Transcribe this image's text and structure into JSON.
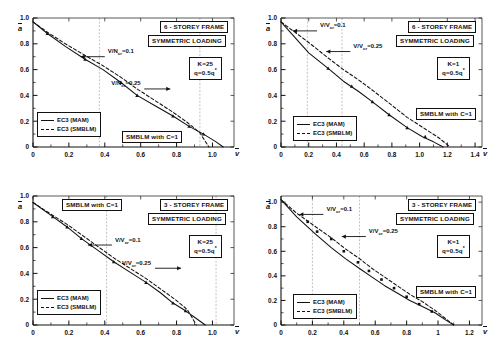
{
  "figure": {
    "axis_labels": {
      "x": "v",
      "y": "a"
    },
    "legend": {
      "solid": "EC3 (MAM)",
      "dashed": "EC3 (SMBLM)"
    }
  },
  "chart_data": [
    {
      "id": "top-left",
      "type": "line",
      "title": "6 - STOREY FRAME",
      "subtitle": "SYMMETRIC LOADING",
      "params": {
        "K": "K=25",
        "q": "q=0.5q"
      },
      "note": "SMBLM with C=1",
      "xlabel": "v",
      "ylabel": "a",
      "xlim": [
        0,
        1.12
      ],
      "ylim": [
        0,
        1.0
      ],
      "xticks": [
        0,
        0.2,
        0.4,
        0.6,
        0.8,
        1.0
      ],
      "xticklabels": [
        "0",
        "0.2",
        "0.4",
        "0.6",
        "0.8",
        "1.0"
      ],
      "yticks": [
        0,
        0.2,
        0.4,
        0.6,
        0.8,
        1.0
      ],
      "yticklabels": [
        "0",
        "0.2",
        "0.4",
        "0.6",
        "0.8",
        "1.0"
      ],
      "grid": "vertical",
      "gridlines_x": [
        0.37,
        0.93
      ],
      "annotations": [
        {
          "text": "V/N",
          "sub": "cr",
          "eq": "=0.1",
          "arrow": "left",
          "x": 0.4,
          "y": 0.7
        },
        {
          "text": "V/N",
          "sub": "cr",
          "eq": "=0.25",
          "arrow": "right",
          "x": 0.62,
          "y": 0.45
        }
      ],
      "series": [
        {
          "name": "EC3 (MAM)",
          "style": "solid",
          "x": [
            0.0,
            0.08,
            0.18,
            0.29,
            0.39,
            0.49,
            0.58,
            0.68,
            0.78,
            0.87,
            0.95,
            1.02,
            1.06
          ],
          "y": [
            0.97,
            0.88,
            0.78,
            0.68,
            0.6,
            0.5,
            0.4,
            0.32,
            0.24,
            0.16,
            0.1,
            0.04,
            0.0
          ]
        },
        {
          "name": "EC3 (SMBLM)",
          "style": "dashed",
          "x": [
            0.0,
            0.08,
            0.18,
            0.29,
            0.39,
            0.49,
            0.58,
            0.68,
            0.78,
            0.86,
            0.93,
            0.98
          ],
          "y": [
            0.97,
            0.89,
            0.8,
            0.71,
            0.63,
            0.54,
            0.45,
            0.36,
            0.27,
            0.19,
            0.11,
            0.0
          ]
        }
      ],
      "markers_x": [
        0.08,
        0.29,
        0.49,
        0.58,
        0.78,
        0.87,
        0.95
      ],
      "markers_y": [
        0.88,
        0.68,
        0.5,
        0.4,
        0.24,
        0.16,
        0.1
      ]
    },
    {
      "id": "top-right",
      "type": "line",
      "title": "6 - STOREY FRAME",
      "subtitle": "SYMMETRIC LOADING",
      "params": {
        "K": "K=1",
        "q": "q=0.5q"
      },
      "note": "SMBLM with C=1",
      "xlabel": "v",
      "ylabel": "a",
      "xlim": [
        0,
        1.45
      ],
      "ylim": [
        0,
        1.0
      ],
      "xticks": [
        0,
        0.2,
        0.4,
        0.6,
        0.8,
        1.0,
        1.2,
        1.4
      ],
      "xticklabels": [
        "0",
        "0.2",
        "0.4",
        "0.6",
        "0.8",
        "1.0",
        "1.2",
        "1.4"
      ],
      "yticks": [
        0,
        0.2,
        0.4,
        0.6,
        0.8,
        1.0
      ],
      "yticklabels": [
        "0",
        "0.2",
        "0.4",
        "0.6",
        "0.8",
        "1.0"
      ],
      "grid": "vertical",
      "gridlines_x": [
        0.19,
        0.44
      ],
      "annotations": [
        {
          "text": "V/V",
          "sub": "cr",
          "eq": "=0.1",
          "arrow": "left",
          "x": 0.26,
          "y": 0.9
        },
        {
          "text": "V/V",
          "sub": "cr",
          "eq": "=0.25",
          "arrow": "left",
          "x": 0.5,
          "y": 0.74
        }
      ],
      "series": [
        {
          "name": "EC3 (MAM)",
          "style": "solid",
          "x": [
            0.0,
            0.1,
            0.2,
            0.34,
            0.45,
            0.56,
            0.66,
            0.78,
            0.91,
            1.02,
            1.1,
            1.17
          ],
          "y": [
            0.97,
            0.85,
            0.73,
            0.61,
            0.51,
            0.43,
            0.35,
            0.25,
            0.15,
            0.08,
            0.04,
            0.0
          ]
        },
        {
          "name": "EC3 (SMBLM)",
          "style": "dashed",
          "x": [
            0.0,
            0.1,
            0.2,
            0.34,
            0.45,
            0.56,
            0.66,
            0.78,
            0.91,
            1.04,
            1.14,
            1.22
          ],
          "y": [
            0.97,
            0.89,
            0.81,
            0.69,
            0.6,
            0.52,
            0.44,
            0.34,
            0.23,
            0.14,
            0.07,
            0.0
          ]
        }
      ],
      "markers_x": [
        0.34,
        0.51,
        0.66,
        0.78,
        0.91,
        1.04
      ],
      "markers_y": [
        0.61,
        0.47,
        0.35,
        0.25,
        0.15,
        0.08
      ]
    },
    {
      "id": "bottom-left",
      "type": "line",
      "title": "3 - STOREY FRAME",
      "subtitle": "SYMMETRIC LOADING",
      "params": {
        "K": "K=25",
        "q": "q=0.5q"
      },
      "note": "SMBLM with C=1",
      "xlabel": "v",
      "ylabel": "a",
      "xlim": [
        0,
        1.12
      ],
      "ylim": [
        0,
        1.0
      ],
      "xticks": [
        0,
        0.2,
        0.4,
        0.6,
        0.8,
        1.0
      ],
      "xticklabels": [
        "0",
        "0.2",
        "0.4",
        "0.6",
        "0.8",
        "1.0"
      ],
      "yticks": [
        0,
        0.2,
        0.4,
        0.6,
        0.8,
        1.0
      ],
      "yticklabels": [
        "0",
        "0.2",
        "0.4",
        "0.6",
        "0.8",
        "1.0"
      ],
      "grid": "vertical",
      "gridlines_x": [
        0.41,
        1.02
      ],
      "annotations": [
        {
          "text": "V/V",
          "sub": "cr",
          "eq": "=0.1",
          "arrow": "left",
          "x": 0.44,
          "y": 0.62
        },
        {
          "text": "V/V",
          "sub": "cr",
          "eq": "=0.25",
          "arrow": "right",
          "x": 0.68,
          "y": 0.44
        }
      ],
      "series": [
        {
          "name": "EC3 (MAM)",
          "style": "solid",
          "x": [
            0.0,
            0.11,
            0.19,
            0.27,
            0.36,
            0.45,
            0.54,
            0.63,
            0.71,
            0.78,
            0.85,
            0.9,
            0.96
          ],
          "y": [
            0.95,
            0.84,
            0.76,
            0.67,
            0.58,
            0.49,
            0.41,
            0.33,
            0.25,
            0.17,
            0.11,
            0.06,
            0.0
          ]
        },
        {
          "name": "EC3 (SMBLM)",
          "style": "dashed",
          "x": [
            0.0,
            0.11,
            0.19,
            0.27,
            0.36,
            0.45,
            0.54,
            0.63,
            0.71,
            0.79,
            0.86,
            0.91
          ],
          "y": [
            0.95,
            0.85,
            0.78,
            0.7,
            0.61,
            0.52,
            0.44,
            0.36,
            0.28,
            0.2,
            0.12,
            0.0
          ]
        }
      ],
      "markers_x": [
        0.11,
        0.19,
        0.27,
        0.45,
        0.63,
        0.78,
        0.85
      ],
      "markers_y": [
        0.84,
        0.76,
        0.67,
        0.49,
        0.33,
        0.17,
        0.11
      ]
    },
    {
      "id": "bottom-right",
      "type": "scatter",
      "title": "3 - STOREY FRAME",
      "subtitle": "SYMMETRIC LOADING",
      "params": {
        "K": "K=1",
        "q": "q=0.5q"
      },
      "note": "SMBLM with C=1",
      "xlabel": "v",
      "ylabel": "a",
      "xlim": [
        0,
        1.28
      ],
      "ylim": [
        0,
        1.05
      ],
      "xticks": [
        0,
        0.2,
        0.4,
        0.6,
        0.8,
        1.0,
        1.2
      ],
      "xticklabels": [
        "0",
        "0.2",
        "0.4",
        "0.6",
        "0.8",
        "1",
        "1.2"
      ],
      "yticks": [
        0,
        0.2,
        0.4,
        0.6,
        0.8,
        1.0
      ],
      "yticklabels": [
        "0",
        "0.2",
        "0.4",
        "0.6",
        "0.8",
        "1.0"
      ],
      "grid": "vertical",
      "gridlines_x": [
        0.2,
        0.5
      ],
      "annotations": [
        {
          "text": "V/V",
          "sub": "cr",
          "eq": "=0.1",
          "arrow": "left",
          "x": 0.27,
          "y": 0.9
        },
        {
          "text": "V/V",
          "sub": "cr",
          "eq": "=0.25",
          "arrow": "left",
          "x": 0.54,
          "y": 0.72
        }
      ],
      "series": [
        {
          "name": "EC3 (MAM)",
          "style": "solid",
          "x": [
            0.0,
            0.1,
            0.22,
            0.32,
            0.41,
            0.5,
            0.58,
            0.66,
            0.74,
            0.82,
            0.9,
            0.98,
            1.05,
            1.1
          ],
          "y": [
            1.02,
            0.88,
            0.74,
            0.63,
            0.54,
            0.46,
            0.39,
            0.32,
            0.26,
            0.2,
            0.15,
            0.1,
            0.04,
            0.0
          ]
        },
        {
          "name": "EC3 (SMBLM)",
          "style": "dashed",
          "x": [
            0.0,
            0.1,
            0.22,
            0.32,
            0.41,
            0.5,
            0.58,
            0.66,
            0.74,
            0.82,
            0.9,
            0.98,
            1.05,
            1.1
          ],
          "y": [
            1.02,
            0.91,
            0.8,
            0.71,
            0.62,
            0.54,
            0.46,
            0.39,
            0.32,
            0.25,
            0.19,
            0.12,
            0.05,
            0.0
          ]
        }
      ],
      "markers_x": [
        0.17,
        0.23,
        0.32,
        0.4,
        0.49,
        0.56,
        0.64,
        0.72,
        0.8,
        0.88,
        0.96
      ],
      "markers_y": [
        0.84,
        0.76,
        0.7,
        0.6,
        0.51,
        0.44,
        0.37,
        0.3,
        0.23,
        0.17,
        0.11
      ]
    }
  ]
}
